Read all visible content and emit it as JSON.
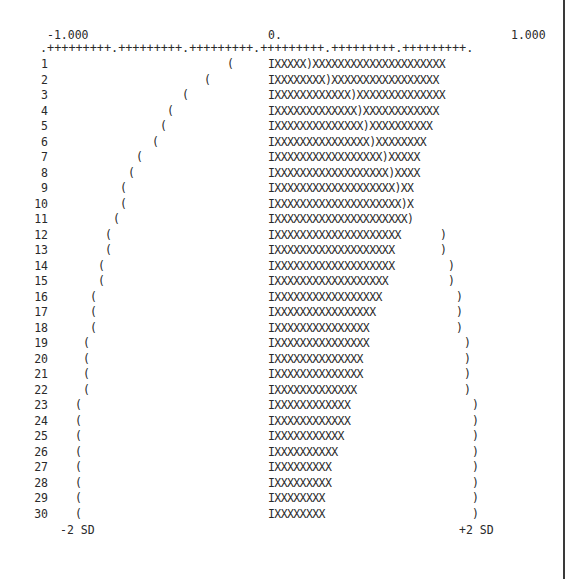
{
  "chart_data": {
    "type": "bar",
    "orientation": "horizontal",
    "title": "",
    "xlabel": "",
    "ylabel": "Lag",
    "xlim": [
      -1.0,
      1.0
    ],
    "x_tick_labels": [
      "-1.000",
      "0.",
      "1.000"
    ],
    "axis_line": ".+++++++++.+++++++++.+++++++++.+++++++++.+++++++++.+++++++++.",
    "categories": [
      1,
      2,
      3,
      4,
      5,
      6,
      7,
      8,
      9,
      10,
      11,
      12,
      13,
      14,
      15,
      16,
      17,
      18,
      19,
      20,
      21,
      22,
      23,
      24,
      25,
      26,
      27,
      28,
      29,
      30
    ],
    "series": [
      {
        "name": "autocorrelation",
        "values": [
          0.9,
          0.87,
          0.9,
          0.87,
          0.83,
          0.8,
          0.77,
          0.77,
          0.73,
          0.73,
          0.73,
          0.67,
          0.63,
          0.63,
          0.6,
          0.57,
          0.53,
          0.5,
          0.5,
          0.47,
          0.47,
          0.43,
          0.4,
          0.4,
          0.37,
          0.33,
          0.3,
          0.3,
          0.27,
          0.27
        ]
      },
      {
        "name": "+2 SD bound",
        "values": [
          0.17,
          0.27,
          0.37,
          0.43,
          0.47,
          0.5,
          0.57,
          0.6,
          0.63,
          0.63,
          0.67,
          0.67,
          0.7,
          0.73,
          0.73,
          0.77,
          0.77,
          0.77,
          0.8,
          0.8,
          0.8,
          0.8,
          0.83,
          0.83,
          0.83,
          0.83,
          0.83,
          0.83,
          0.83,
          0.83
        ]
      },
      {
        "name": "-2 SD bound",
        "values": [
          -0.17,
          -0.27,
          -0.37,
          -0.43,
          -0.47,
          -0.5,
          -0.57,
          -0.6,
          -0.63,
          -0.63,
          -0.67,
          -0.67,
          -0.7,
          -0.73,
          -0.73,
          -0.77,
          -0.77,
          -0.77,
          -0.8,
          -0.8,
          -0.8,
          -0.8,
          -0.83,
          -0.83,
          -0.83,
          -0.83,
          -0.83,
          -0.83,
          -0.83,
          -0.83
        ]
      }
    ],
    "annotations": [
      "-2 SD",
      "+2 SD"
    ],
    "legend": null,
    "grid": false
  },
  "axis": {
    "left_label": "-1.000",
    "center_label": "0.",
    "right_label": "1.000",
    "line": ".+++++++++.+++++++++.+++++++++.+++++++++.+++++++++.+++++++++."
  },
  "rows": [
    {
      "lag": "1",
      "lb_x": 227,
      "bar": "IXXXXX)XXXXXXXXXXXXXXXXXXXXX",
      "ub_x": null
    },
    {
      "lag": "2",
      "lb_x": 204,
      "bar": "IXXXXXXXX)XXXXXXXXXXXXXXXXX",
      "ub_x": null
    },
    {
      "lag": "3",
      "lb_x": 182,
      "bar": "IXXXXXXXXXXXX)XXXXXXXXXXXXXX",
      "ub_x": null
    },
    {
      "lag": "4",
      "lb_x": 167,
      "bar": "IXXXXXXXXXXXXX)XXXXXXXXXXXX",
      "ub_x": null
    },
    {
      "lag": "5",
      "lb_x": 160,
      "bar": "IXXXXXXXXXXXXXX)XXXXXXXXXX",
      "ub_x": null
    },
    {
      "lag": "6",
      "lb_x": 152,
      "bar": "IXXXXXXXXXXXXXXX)XXXXXXXX",
      "ub_x": null
    },
    {
      "lag": "7",
      "lb_x": 136,
      "bar": "IXXXXXXXXXXXXXXXXX)XXXXX",
      "ub_x": null
    },
    {
      "lag": "8",
      "lb_x": 128,
      "bar": "IXXXXXXXXXXXXXXXXXX)XXXX",
      "ub_x": null
    },
    {
      "lag": "9",
      "lb_x": 120,
      "bar": "IXXXXXXXXXXXXXXXXXXX)XX",
      "ub_x": null
    },
    {
      "lag": "10",
      "lb_x": 120,
      "bar": "IXXXXXXXXXXXXXXXXXXXX)X",
      "ub_x": null
    },
    {
      "lag": "11",
      "lb_x": 113,
      "bar": "IXXXXXXXXXXXXXXXXXXXXX)",
      "ub_x": null
    },
    {
      "lag": "12",
      "lb_x": 105,
      "bar": "IXXXXXXXXXXXXXXXXXXXX",
      "ub_x": 440
    },
    {
      "lag": "13",
      "lb_x": 105,
      "bar": "IXXXXXXXXXXXXXXXXXXX",
      "ub_x": 440
    },
    {
      "lag": "14",
      "lb_x": 98,
      "bar": "IXXXXXXXXXXXXXXXXXXX",
      "ub_x": 448
    },
    {
      "lag": "15",
      "lb_x": 98,
      "bar": "IXXXXXXXXXXXXXXXXXX",
      "ub_x": 448
    },
    {
      "lag": "16",
      "lb_x": 90,
      "bar": "IXXXXXXXXXXXXXXXXX",
      "ub_x": 456
    },
    {
      "lag": "17",
      "lb_x": 90,
      "bar": "IXXXXXXXXXXXXXXXX",
      "ub_x": 456
    },
    {
      "lag": "18",
      "lb_x": 90,
      "bar": "IXXXXXXXXXXXXXXX",
      "ub_x": 456
    },
    {
      "lag": "19",
      "lb_x": 83,
      "bar": "IXXXXXXXXXXXXXXX",
      "ub_x": 464
    },
    {
      "lag": "20",
      "lb_x": 83,
      "bar": "IXXXXXXXXXXXXXX",
      "ub_x": 464
    },
    {
      "lag": "21",
      "lb_x": 83,
      "bar": "IXXXXXXXXXXXXXX",
      "ub_x": 464
    },
    {
      "lag": "22",
      "lb_x": 83,
      "bar": "IXXXXXXXXXXXXX",
      "ub_x": 464
    },
    {
      "lag": "23",
      "lb_x": 75,
      "bar": "IXXXXXXXXXXXX",
      "ub_x": 472
    },
    {
      "lag": "24",
      "lb_x": 75,
      "bar": "IXXXXXXXXXXXX",
      "ub_x": 472
    },
    {
      "lag": "25",
      "lb_x": 75,
      "bar": "IXXXXXXXXXXX",
      "ub_x": 472
    },
    {
      "lag": "26",
      "lb_x": 75,
      "bar": "IXXXXXXXXXX",
      "ub_x": 472
    },
    {
      "lag": "27",
      "lb_x": 75,
      "bar": "IXXXXXXXXX",
      "ub_x": 472
    },
    {
      "lag": "28",
      "lb_x": 75,
      "bar": "IXXXXXXXXX",
      "ub_x": 472
    },
    {
      "lag": "29",
      "lb_x": 75,
      "bar": "IXXXXXXXX",
      "ub_x": 472
    },
    {
      "lag": "30",
      "lb_x": 75,
      "bar": "IXXXXXXXX",
      "ub_x": 472
    }
  ],
  "bound_glyphs": {
    "lower": "(",
    "upper": ")"
  },
  "sd_labels": {
    "lower": "-2 SD",
    "upper": "+2 SD"
  }
}
